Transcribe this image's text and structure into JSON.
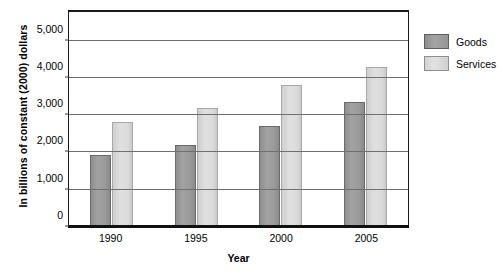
{
  "chart_data": {
    "type": "bar",
    "title": "",
    "xlabel": "Year",
    "ylabel": "In billions of constant (2000) dollars",
    "categories": [
      "1990",
      "1995",
      "2000",
      "2005"
    ],
    "series": [
      {
        "name": "Goods",
        "color": "#9a9a9a",
        "values": [
          1930,
          2200,
          2700,
          3350
        ]
      },
      {
        "name": "Services",
        "color": "#d8d8d8",
        "values": [
          2830,
          3200,
          3800,
          4300
        ]
      }
    ],
    "ylim": [
      0,
      5770
    ],
    "yticks": [
      0,
      1000,
      2000,
      3000,
      4000,
      5000
    ],
    "ytick_labels": [
      "0",
      "1,000",
      "2,000",
      "3,000",
      "4,000",
      "5,000"
    ],
    "grid": true,
    "legend_position": "right"
  },
  "legend": {
    "items": [
      {
        "label": "Goods"
      },
      {
        "label": "Services"
      }
    ]
  }
}
